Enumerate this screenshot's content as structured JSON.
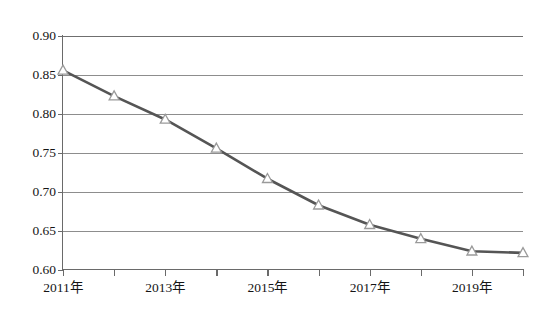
{
  "chart_data": {
    "type": "line",
    "title": "",
    "subtitle": "",
    "xlabel": "",
    "ylabel": "",
    "categories": [
      "2011年",
      "2012年",
      "2013年",
      "2014年",
      "2015年",
      "2016年",
      "2017年",
      "2018年",
      "2019年",
      "2020年"
    ],
    "x": [
      2011,
      2012,
      2013,
      2014,
      2015,
      2016,
      2017,
      2018,
      2019,
      2020
    ],
    "values": [
      0.856,
      0.823,
      0.793,
      0.756,
      0.717,
      0.683,
      0.658,
      0.64,
      0.624,
      0.622
    ],
    "series": [
      {
        "name": "series-1",
        "values": [
          0.856,
          0.823,
          0.793,
          0.756,
          0.717,
          0.683,
          0.658,
          0.64,
          0.624,
          0.622
        ],
        "line_color": "#555555",
        "marker": "triangle",
        "marker_fill": "#ffffff",
        "marker_edge": "#9a9a9a"
      }
    ],
    "ylim": [
      0.6,
      0.9
    ],
    "ytick_values": [
      0.9,
      0.85,
      0.8,
      0.75,
      0.7,
      0.65,
      0.6
    ],
    "ytick_labels": [
      "0.90",
      "0.85",
      "0.80",
      "0.75",
      "0.70",
      "0.65",
      "0.60"
    ],
    "xtick_labels": [
      "2011年",
      "2013年",
      "2015年",
      "2017年",
      "2019年"
    ],
    "xtick_values": [
      2011,
      2013,
      2015,
      2017,
      2019
    ],
    "grid": true,
    "grid_axis": "y",
    "legend": false,
    "legend_position": "none",
    "annotations": []
  },
  "colors": {
    "background": "#ffffff",
    "axis": "#6a6a6a",
    "gridline": "#8d8d8d",
    "line": "#555555",
    "marker_edge": "#9a9a9a",
    "marker_fill": "#ffffff",
    "text": "#151515"
  }
}
